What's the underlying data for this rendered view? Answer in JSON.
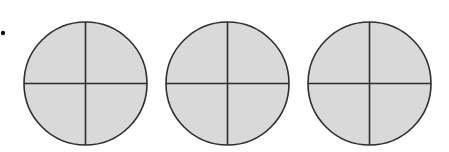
{
  "figure": {
    "bullet": {
      "cx": 3,
      "cy": 33,
      "r": 2.2
    },
    "colors": {
      "background": "#ffffff",
      "fill": "#d9d9d9",
      "stroke": "#2e2e2e",
      "bullet": "#111111"
    },
    "circles": [
      {
        "id": 1,
        "cx": 85.5,
        "cy": 83.5,
        "r": 61.5,
        "parts": 4,
        "shaded_parts": 4
      },
      {
        "id": 2,
        "cx": 227.5,
        "cy": 83.5,
        "r": 61.5,
        "parts": 4,
        "shaded_parts": 4
      },
      {
        "id": 3,
        "cx": 369.5,
        "cy": 83.5,
        "r": 61.5,
        "parts": 4,
        "shaded_parts": 4
      }
    ]
  }
}
